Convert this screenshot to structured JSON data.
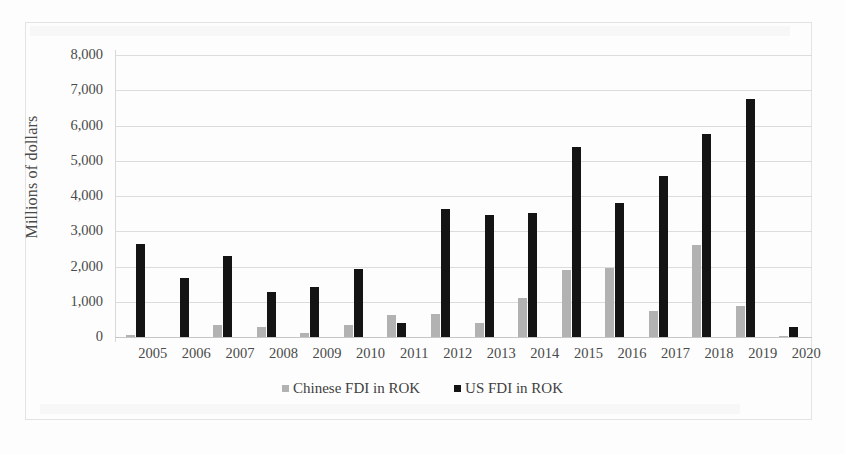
{
  "chart_data": {
    "type": "bar",
    "title": "",
    "xlabel": "",
    "ylabel": "Millions of dollars",
    "ylim": [
      0,
      8000
    ],
    "ytick_labels": [
      "0",
      "1,000",
      "2,000",
      "3,000",
      "4,000",
      "5,000",
      "6,000",
      "7,000",
      "8,000"
    ],
    "ytick_values": [
      0,
      1000,
      2000,
      3000,
      4000,
      5000,
      6000,
      7000,
      8000
    ],
    "grid": true,
    "legend_position": "bottom",
    "categories": [
      "2005",
      "2006",
      "2007",
      "2008",
      "2009",
      "2010",
      "2011",
      "2012",
      "2013",
      "2014",
      "2015",
      "2016",
      "2017",
      "2018",
      "2019",
      "2020"
    ],
    "series": [
      {
        "name": "Chinese FDI in ROK",
        "color": "#b2b2b2",
        "values": [
          60,
          0,
          350,
          290,
          110,
          350,
          620,
          660,
          400,
          1120,
          1900,
          1950,
          730,
          2620,
          880,
          40
        ]
      },
      {
        "name": "US FDI in ROK",
        "color": "#141414",
        "values": [
          2650,
          1670,
          2300,
          1280,
          1430,
          1930,
          390,
          3620,
          3450,
          3530,
          5380,
          3800,
          4580,
          5750,
          6750,
          280
        ]
      }
    ]
  },
  "legend": {
    "items": [
      {
        "label": "Chinese FDI in ROK",
        "color": "#b2b2b2"
      },
      {
        "label": "US FDI in ROK",
        "color": "#141414"
      }
    ]
  }
}
